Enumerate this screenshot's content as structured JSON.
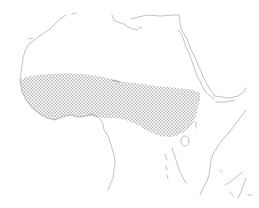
{
  "map": {
    "subject": "Africa outline with shaded Sahel/West Africa belt",
    "background_color": "#ffffff",
    "coastline_color": "#a8a8a8",
    "shaded_region": {
      "name": "sahel-band",
      "pattern": "dot-stipple",
      "dot_color": "#6a6a6a"
    },
    "labels": []
  }
}
